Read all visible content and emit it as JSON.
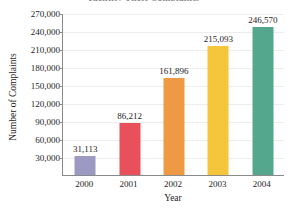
{
  "chart_data": {
    "type": "bar",
    "title": "Identity Theft Complaints",
    "xlabel": "Year",
    "ylabel": "Number of Complaints",
    "categories": [
      "2000",
      "2001",
      "2002",
      "2003",
      "2004"
    ],
    "values": [
      31113,
      86212,
      161896,
      215093,
      246570
    ],
    "value_labels": [
      "31,113",
      "86,212",
      "161,896",
      "215,093",
      "246,570"
    ],
    "bar_colors": [
      "#9c99c2",
      "#e8505b",
      "#ee9944",
      "#f5c63c",
      "#54a78c"
    ],
    "ylim": [
      0,
      270000
    ],
    "ytick_values": [
      30000,
      60000,
      90000,
      120000,
      150000,
      180000,
      210000,
      240000,
      270000
    ],
    "ytick_labels": [
      "30,000",
      "60,000",
      "90,000",
      "120,000",
      "150,000",
      "180,000",
      "210,000",
      "240,000",
      "270,000"
    ],
    "grid": true,
    "legend": "none",
    "axis_color": "#8a8a8a",
    "gridline_color": "#ededed",
    "plot_background": "#ffffff"
  }
}
